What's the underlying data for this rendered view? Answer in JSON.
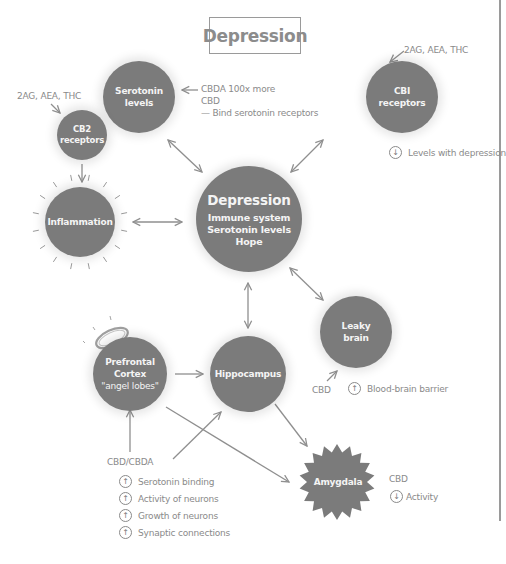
{
  "title": "Depression",
  "colors": {
    "node_fill": "#7b7b7b",
    "text_gray": "#8a8a8a",
    "line_gray": "#8f8f8f"
  },
  "nodes": {
    "serotonin": {
      "lines": [
        "Serotonin",
        "levels"
      ]
    },
    "cb2": {
      "lines": [
        "CB2",
        "receptors"
      ]
    },
    "cb1": {
      "lines": [
        "CBI",
        "receptors"
      ]
    },
    "inflammation": {
      "lines": [
        "Inflammation"
      ]
    },
    "depression": {
      "title": "Depression",
      "lines": [
        "Immune system",
        "Serotonin levels",
        "Hope"
      ]
    },
    "leaky_brain": {
      "lines": [
        "Leaky",
        "brain"
      ]
    },
    "prefrontal": {
      "lines": [
        "Prefrontal",
        "Cortex",
        "\"angel lobes\""
      ]
    },
    "hippocampus": {
      "lines": [
        "Hippocampus"
      ]
    },
    "amygdala": {
      "lines": [
        "Amygdala"
      ]
    }
  },
  "annotations": {
    "serotonin_note": [
      "CBDA 100x more",
      "CBD",
      "— Bind serotonin receptors"
    ],
    "cb2_ligands": "2AG, AEA, THC",
    "cb1_ligands": "2AG, AEA, THC",
    "cb1_effect": {
      "direction": "down",
      "text": "Levels with depression"
    },
    "leaky_cbd": "CBD",
    "leaky_effect": {
      "direction": "up",
      "text": "Blood-brain barrier"
    },
    "prefrontal_source": "CBD/CBDA",
    "prefrontal_effects": [
      {
        "direction": "up",
        "text": "Serotonin binding"
      },
      {
        "direction": "up",
        "text": "Activity of neurons"
      },
      {
        "direction": "up",
        "text": "Growth of neurons"
      },
      {
        "direction": "up",
        "text": "Synaptic connections"
      }
    ],
    "amygdala_cbd": "CBD",
    "amygdala_effect": {
      "direction": "down",
      "text": "Activity"
    }
  },
  "icons": {
    "up": "↑",
    "down": "↓",
    "left_arrow": "←"
  }
}
